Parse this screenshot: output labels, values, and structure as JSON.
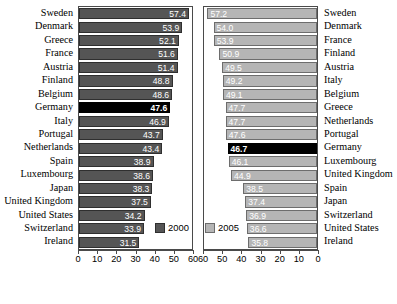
{
  "chart_data": {
    "type": "bar",
    "title": "",
    "xlabel": "",
    "ylabel": "",
    "orientation": "horizontal",
    "grid": false,
    "panels": [
      {
        "name": "left-panel",
        "series_name": "2000",
        "color": "#555555",
        "highlight_color": "#000000",
        "highlight_category": "Germany",
        "xlim": [
          0,
          60
        ],
        "axis_direction": "left-to-right",
        "ticks": [
          0,
          10,
          20,
          30,
          40,
          50,
          60
        ],
        "categories": [
          "Sweden",
          "Denmark",
          "Greece",
          "France",
          "Austria",
          "Finland",
          "Belgium",
          "Germany",
          "Italy",
          "Portugal",
          "Netherlands",
          "Spain",
          "Luxembourg",
          "Japan",
          "United Kingdom",
          "United States",
          "Switzerland",
          "Ireland"
        ],
        "values": [
          57.4,
          53.9,
          52.1,
          51.6,
          51.4,
          48.8,
          48.6,
          47.6,
          46.9,
          43.7,
          43.4,
          38.9,
          38.6,
          38.3,
          37.5,
          34.2,
          33.9,
          31.5
        ]
      },
      {
        "name": "right-panel",
        "series_name": "2005",
        "color": "#b5b5b5",
        "highlight_color": "#000000",
        "highlight_category": "Germany",
        "xlim": [
          0,
          60
        ],
        "axis_direction": "right-to-left",
        "ticks": [
          60,
          50,
          40,
          30,
          20,
          10,
          0
        ],
        "categories": [
          "Sweden",
          "Denmark",
          "France",
          "Finland",
          "Austria",
          "Italy",
          "Belgium",
          "Greece",
          "Netherlands",
          "Portugal",
          "Germany",
          "Luxembourg",
          "United Kingdom",
          "Spain",
          "Japan",
          "Switzerland",
          "United States",
          "Ireland"
        ],
        "values": [
          57.2,
          54.0,
          53.9,
          50.9,
          49.5,
          49.2,
          49.1,
          47.7,
          47.7,
          47.6,
          46.7,
          46.1,
          44.9,
          38.5,
          37.4,
          36.9,
          36.6,
          35.8
        ]
      }
    ],
    "legend": [
      {
        "label": "2000",
        "color": "#555555"
      },
      {
        "label": "2005",
        "color": "#b5b5b5"
      }
    ],
    "legend_position": "bottom-inside"
  }
}
